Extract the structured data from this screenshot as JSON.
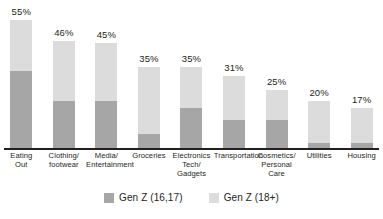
{
  "chart_data": {
    "type": "bar",
    "subtype": "stacked-bar",
    "title": "",
    "xlabel": "",
    "ylabel": "",
    "ylim": [
      0,
      55
    ],
    "grid": false,
    "legend_position": "bottom",
    "categories": [
      "Eating Out",
      "Clothing/ footwear",
      "Media/ Entertainment",
      "Groceries",
      "Electronics Tech/ Gadgets",
      "Transportation",
      "Cosmetics/ Personal Care",
      "Utilities",
      "Housing"
    ],
    "category_lines": [
      [
        "Eating",
        "Out"
      ],
      [
        "Clothing/",
        "footwear"
      ],
      [
        "Media/",
        "Entertainment"
      ],
      [
        "Groceries"
      ],
      [
        "Electronics",
        "Tech/",
        "Gadgets"
      ],
      [
        "Transportation"
      ],
      [
        "Cosmetics/",
        "Personal",
        "Care"
      ],
      [
        "Utilities"
      ],
      [
        "Housing"
      ]
    ],
    "series": [
      {
        "name": "Gen Z (16,17)",
        "color": "#a6a6a6",
        "values": [
          33,
          20,
          20,
          6,
          17,
          12,
          12,
          2,
          2
        ]
      },
      {
        "name": "Gen Z (18+)",
        "color": "#dcdcdc",
        "values": [
          22,
          26,
          25,
          29,
          18,
          19,
          13,
          18,
          15
        ]
      }
    ],
    "totals": [
      55,
      46,
      45,
      35,
      35,
      31,
      25,
      20,
      17
    ],
    "data_labels": [
      "55%",
      "46%",
      "45%",
      "35%",
      "35%",
      "31%",
      "25%",
      "20%",
      "17%"
    ]
  },
  "legend": {
    "items": [
      {
        "label": "Gen Z (16,17)",
        "color": "#a6a6a6"
      },
      {
        "label": "Gen Z (18+)",
        "color": "#dcdcdc"
      }
    ]
  },
  "colors": {
    "dark_segment": "#a6a6a6",
    "light_segment": "#dcdcdc",
    "axis": "#231f20",
    "text": "#231f20",
    "background": "#ffffff"
  }
}
